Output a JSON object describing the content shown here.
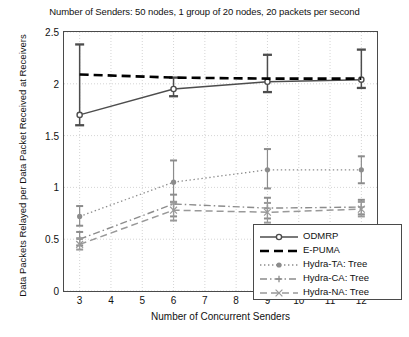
{
  "chart_data": {
    "type": "line",
    "title": "Number of Senders: 50 nodes, 1 group of 20 nodes, 20 packets per second",
    "xlabel": "Number of Concurrent Senders",
    "ylabel": "Data Packets Relayed per Data Packet Received at Receivers",
    "x": [
      3,
      6,
      9,
      12
    ],
    "xlim": [
      2.5,
      12.5
    ],
    "ylim": [
      0,
      2.5
    ],
    "xticks": [
      3,
      4,
      5,
      6,
      7,
      8,
      9,
      10,
      11,
      12
    ],
    "yticks": [
      "0",
      "0.5",
      "1",
      "1.5",
      "2",
      "2.5"
    ],
    "ytick_values": [
      0,
      0.5,
      1,
      1.5,
      2,
      2.5
    ],
    "grid": true,
    "legend_position": "lower right",
    "series": [
      {
        "name": "ODMRP",
        "style": "solid-circle",
        "color": "#4d4d4d",
        "values": [
          1.7,
          1.95,
          2.02,
          2.04
        ],
        "err_low": [
          1.6,
          1.88,
          1.92,
          1.96
        ],
        "err_high": [
          2.38,
          2.06,
          2.28,
          2.33
        ]
      },
      {
        "name": "E-PUMA",
        "style": "dashed",
        "color": "#000000",
        "values": [
          2.09,
          2.06,
          2.05,
          2.05
        ],
        "err_low": [
          2.09,
          2.06,
          2.05,
          2.05
        ],
        "err_high": [
          2.09,
          2.06,
          2.05,
          2.05
        ]
      },
      {
        "name": "Hydra-TA: Tree",
        "style": "dotted-dot",
        "color": "#8c8c8c",
        "values": [
          0.72,
          1.05,
          1.17,
          1.17
        ],
        "err_low": [
          0.63,
          0.86,
          0.99,
          1.04
        ],
        "err_high": [
          0.82,
          1.26,
          1.37,
          1.3
        ]
      },
      {
        "name": "Hydra-CA: Tree",
        "style": "dashdot-plus",
        "color": "#8c8c8c",
        "values": [
          0.5,
          0.84,
          0.8,
          0.81
        ],
        "err_low": [
          0.44,
          0.72,
          0.7,
          0.74
        ],
        "err_high": [
          0.57,
          0.93,
          0.9,
          0.88
        ]
      },
      {
        "name": "Hydra-NA: Tree",
        "style": "dashed-light",
        "color": "#999999",
        "values": [
          0.45,
          0.78,
          0.76,
          0.79
        ],
        "err_low": [
          0.4,
          0.68,
          0.66,
          0.72
        ],
        "err_high": [
          0.51,
          0.86,
          0.85,
          0.86
        ]
      }
    ]
  }
}
